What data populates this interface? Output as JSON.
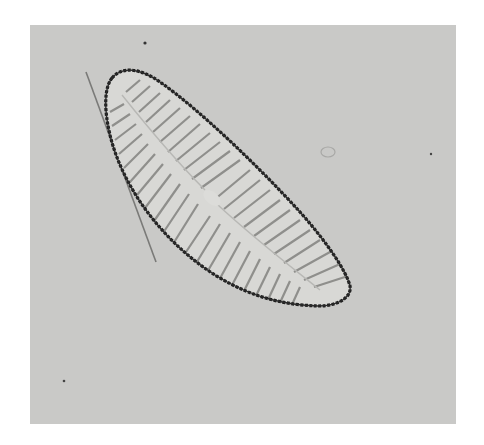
{
  "image": {
    "kind": "micrograph",
    "subject": "diatom-valve",
    "colors": {
      "background": "#ffffff",
      "field": "#c9c9c7",
      "valve_fill": "#d6d6d3",
      "outline": "#1e1e1e",
      "striae": "#8a8a88"
    }
  }
}
